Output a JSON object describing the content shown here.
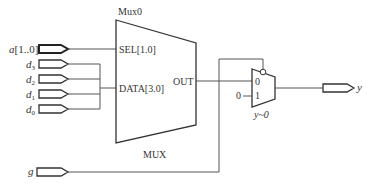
{
  "diagram": {
    "type": "rtl-schematic",
    "inputs": [
      {
        "id": "a",
        "label": "a",
        "suffix": "[1..0]",
        "bus": true
      },
      {
        "id": "d3",
        "label": "d",
        "sub": "3"
      },
      {
        "id": "d2",
        "label": "d",
        "sub": "2"
      },
      {
        "id": "d1",
        "label": "d",
        "sub": "1"
      },
      {
        "id": "d0",
        "label": "d",
        "sub": "0"
      },
      {
        "id": "g",
        "label": "g"
      }
    ],
    "outputs": [
      {
        "id": "y",
        "label": "y"
      }
    ],
    "mux_main": {
      "instance_name": "Mux0",
      "type_label": "MUX",
      "ports": {
        "sel": "SEL[1.0]",
        "data": "DATA[3.0]",
        "out": "OUT"
      }
    },
    "mux_small": {
      "instance_name": "y~0",
      "port0": "0",
      "port1": "1",
      "const_input": "0"
    }
  }
}
